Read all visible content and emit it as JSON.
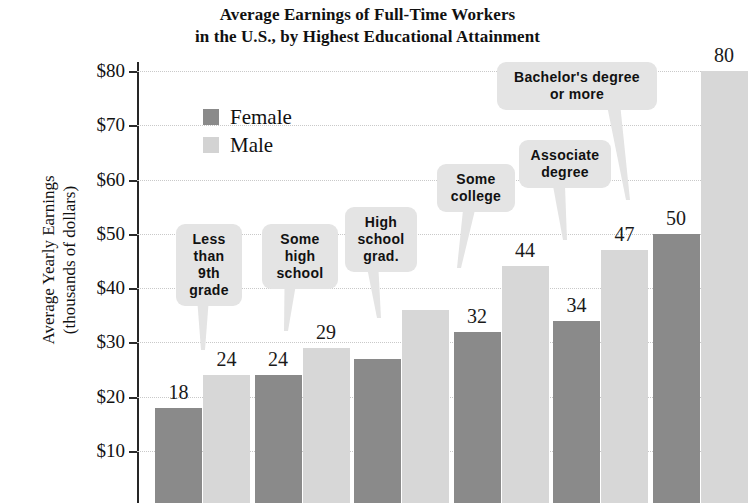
{
  "chart_data": {
    "type": "bar",
    "title": "Average Earnings of Full-Time Workers in the U.S., by Highest Educational Attainment",
    "title_lines": [
      "Average Earnings of Full-Time Workers",
      "in the U.S., by Highest Educational Attainment"
    ],
    "xlabel": "",
    "ylabel": "Average Yearly Earnings (thousands of dollars)",
    "ylabel_lines": [
      "Average Yearly Earnings",
      "(thousands of dollars)"
    ],
    "ylim": [
      0,
      80
    ],
    "ytick_labels": [
      "$80",
      "$70",
      "$60",
      "$50",
      "$40",
      "$30",
      "$20",
      "$10"
    ],
    "ytick_values": [
      80,
      70,
      60,
      50,
      40,
      30,
      20,
      10
    ],
    "grid": true,
    "legend_position": "upper-left-inside",
    "categories": [
      "Less than 9th grade",
      "Some high school",
      "High school grad.",
      "Some college",
      "Associate degree",
      "Bachelor's degree or more"
    ],
    "category_label_lines": [
      [
        "Less",
        "than",
        "9th",
        "grade"
      ],
      [
        "Some",
        "high",
        "school"
      ],
      [
        "High",
        "school",
        "grad."
      ],
      [
        "Some",
        "college"
      ],
      [
        "Associate",
        "degree"
      ],
      [
        "Bachelor's degree",
        "or more"
      ]
    ],
    "series": [
      {
        "name": "Female",
        "color": "#8a8a8a",
        "values": [
          18,
          24,
          27,
          32,
          34,
          50
        ]
      },
      {
        "name": "Male",
        "color": "#d7d7d7",
        "values": [
          24,
          29,
          36,
          44,
          47,
          80
        ]
      }
    ],
    "data_labels": {
      "female": [
        "18",
        "24",
        "",
        "32",
        "34",
        "50"
      ],
      "male": [
        "24",
        "29",
        "",
        "44",
        "47",
        "80"
      ]
    },
    "units": "thousands of dollars"
  },
  "legend": {
    "items": [
      {
        "label": "Female",
        "color": "#8a8a8a"
      },
      {
        "label": "Male",
        "color": "#d3d3d3"
      }
    ]
  }
}
